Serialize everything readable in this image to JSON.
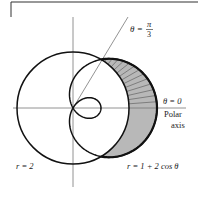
{
  "diagram": {
    "pole": {
      "x": 73,
      "y": 108
    },
    "unit_px": 28,
    "curves": [
      {
        "name": "circle",
        "equation": "r = 2",
        "label": "r = 2"
      },
      {
        "name": "limacon",
        "equation": "r = 1 + 2 cos θ",
        "label": "r = 1 + 2 cos θ"
      }
    ],
    "rays": [
      {
        "angle_label": "θ = π/3",
        "angle_rad": 1.0472
      },
      {
        "angle_label": "θ = 0",
        "angle_rad": 0
      }
    ],
    "labels": {
      "theta_pi3_prefix": "θ =",
      "theta_pi3_num": "π",
      "theta_pi3_den": "3",
      "theta_zero": "θ = 0",
      "polar": "Polar",
      "axis": "axis",
      "r_circle": "r = 2",
      "r_limacon": "r = 1 + 2 cos θ"
    },
    "shading": {
      "upper": "hatched (0 ≤ θ ≤ π/3)",
      "lower": "solid gray (−π/3 ≤ θ ≤ 0)",
      "fill_color": "#b8b8b8",
      "hatch_color": "#555555"
    },
    "colors": {
      "curve": "#111111",
      "axis": "#777777",
      "frame": "#333333"
    }
  }
}
